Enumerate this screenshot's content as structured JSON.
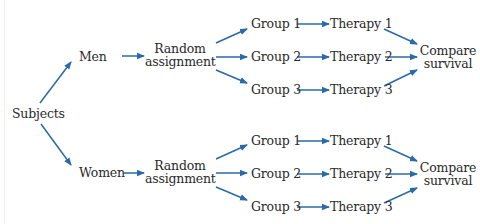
{
  "diagram": {
    "root": {
      "label": "Subjects"
    },
    "arrow_color": "#2a6aa6",
    "branches": [
      {
        "id": "men",
        "label": "Men",
        "assignment": {
          "line1": "Random",
          "line2": "assignment"
        },
        "groups": [
          {
            "group": "Group 1",
            "therapy": "Therapy 1"
          },
          {
            "group": "Group 2",
            "therapy": "Therapy 2"
          },
          {
            "group": "Group 3",
            "therapy": "Therapy 3"
          }
        ],
        "outcome": {
          "line1": "Compare",
          "line2": "survival"
        }
      },
      {
        "id": "women",
        "label": "Women",
        "assignment": {
          "line1": "Random",
          "line2": "assignment"
        },
        "groups": [
          {
            "group": "Group 1",
            "therapy": "Therapy 1"
          },
          {
            "group": "Group 2",
            "therapy": "Therapy 2"
          },
          {
            "group": "Group 3",
            "therapy": "Therapy 3"
          }
        ],
        "outcome": {
          "line1": "Compare",
          "line2": "survival"
        }
      }
    ]
  }
}
